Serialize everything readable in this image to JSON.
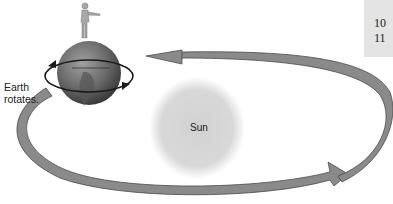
{
  "diagram": {
    "earth_label_line1": "Earth",
    "earth_label_line2": "rotates.",
    "sun_label": "Sun",
    "side_numbers": [
      "10",
      "11"
    ],
    "colors": {
      "orbit_arrow": "#8a8a8a",
      "orbit_arrow_edge": "#4a4a4a",
      "sun": "#d9d9d9",
      "earth": "#6e6e6e",
      "side_box": "#e4e4e4"
    },
    "icons": [
      "person-icon",
      "earth-globe-icon",
      "rotation-arrow-icon",
      "orbit-arrow-icon",
      "sun-icon"
    ]
  }
}
